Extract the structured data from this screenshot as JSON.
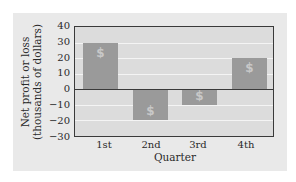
{
  "chart_data": {
    "type": "bar",
    "title": "",
    "xlabel": "Quarter",
    "ylabel": "Net profit or loss (thousands of dollars)",
    "ylabel_lines": [
      "Net profit or loss",
      "(thousands of dollars)"
    ],
    "categories": [
      "1st",
      "2nd",
      "3rd",
      "4th"
    ],
    "values": [
      30,
      -20,
      -10,
      20
    ],
    "ylim": [
      -30,
      40
    ],
    "yticks": [
      40,
      30,
      20,
      10,
      0,
      -10,
      -20,
      -30
    ],
    "ytick_labels": [
      "40",
      "30",
      "20",
      "10",
      "0",
      "−10",
      "−20",
      "−30"
    ],
    "grid": true,
    "legend": null,
    "bar_icon": "dollar-sign-icon",
    "bar_icon_glyph": "$",
    "colors": {
      "bar": "#9a9a9a",
      "plot_bg": "#dcdcdc",
      "panel_bg": "#e9e9e9",
      "grid": "#f4f4f4",
      "axis": "#3a3a3a"
    }
  }
}
